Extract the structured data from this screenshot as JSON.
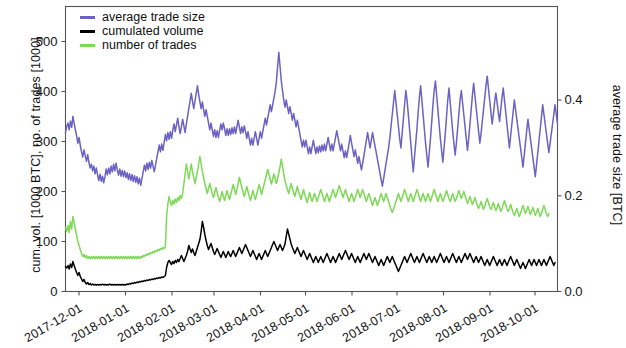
{
  "chart_data": {
    "type": "line",
    "title": "",
    "xlabel": "",
    "ylabel": "cum. vol. [1000 BTC], no. of trades [1000]",
    "y2label": "average trade size [BTC]",
    "grid": false,
    "legend_position": "upper-left-inside",
    "xlim": [
      "2017-11-22",
      "2018-10-16"
    ],
    "ylim": [
      0,
      570
    ],
    "y2lim": [
      0,
      0.5955
    ],
    "yticks": [
      0,
      100,
      200,
      300,
      400,
      500
    ],
    "ytick_labels": [
      "0",
      "100",
      "200",
      "300",
      "400",
      "500"
    ],
    "y2ticks": [
      0.0,
      0.2,
      0.4
    ],
    "y2tick_labels": [
      "0.0",
      "0.2",
      "0.4"
    ],
    "xticks": [
      "2017-12-01",
      "2018-01-01",
      "2018-02-01",
      "2018-03-01",
      "2018-04-01",
      "2018-05-01",
      "2018-06-01",
      "2018-07-01",
      "2018-08-01",
      "2018-09-01",
      "2018-10-01"
    ],
    "series": [
      {
        "name": "average trade size",
        "axis": "right",
        "color": "#6a63c4",
        "unit": "BTC",
        "values": [
          0.332,
          0.345,
          0.352,
          0.338,
          0.356,
          0.343,
          0.366,
          0.352,
          0.338,
          0.325,
          0.31,
          0.322,
          0.305,
          0.292,
          0.281,
          0.296,
          0.284,
          0.272,
          0.286,
          0.27,
          0.258,
          0.266,
          0.252,
          0.262,
          0.246,
          0.258,
          0.244,
          0.232,
          0.245,
          0.23,
          0.241,
          0.227,
          0.24,
          0.256,
          0.244,
          0.258,
          0.246,
          0.262,
          0.25,
          0.266,
          0.252,
          0.268,
          0.254,
          0.243,
          0.256,
          0.241,
          0.253,
          0.24,
          0.252,
          0.238,
          0.248,
          0.234,
          0.246,
          0.232,
          0.244,
          0.23,
          0.242,
          0.228,
          0.24,
          0.225,
          0.237,
          0.222,
          0.236,
          0.25,
          0.264,
          0.252,
          0.268,
          0.255,
          0.27,
          0.258,
          0.274,
          0.262,
          0.25,
          0.264,
          0.278,
          0.292,
          0.306,
          0.292,
          0.308,
          0.295,
          0.312,
          0.328,
          0.315,
          0.332,
          0.318,
          0.334,
          0.32,
          0.336,
          0.35,
          0.334,
          0.348,
          0.362,
          0.345,
          0.33,
          0.344,
          0.36,
          0.346,
          0.332,
          0.35,
          0.366,
          0.382,
          0.398,
          0.414,
          0.398,
          0.382,
          0.398,
          0.414,
          0.43,
          0.412,
          0.396,
          0.382,
          0.396,
          0.38,
          0.366,
          0.38,
          0.366,
          0.352,
          0.338,
          0.352,
          0.338,
          0.324,
          0.338,
          0.322,
          0.336,
          0.322,
          0.336,
          0.35,
          0.338,
          0.352,
          0.34,
          0.326,
          0.34,
          0.326,
          0.34,
          0.328,
          0.342,
          0.33,
          0.344,
          0.33,
          0.344,
          0.358,
          0.344,
          0.33,
          0.344,
          0.332,
          0.346,
          0.334,
          0.32,
          0.334,
          0.32,
          0.306,
          0.32,
          0.306,
          0.32,
          0.334,
          0.32,
          0.306,
          0.32,
          0.334,
          0.32,
          0.334,
          0.348,
          0.362,
          0.348,
          0.362,
          0.376,
          0.39,
          0.376,
          0.39,
          0.404,
          0.418,
          0.438,
          0.47,
          0.5,
          0.47,
          0.44,
          0.42,
          0.4,
          0.385,
          0.4,
          0.386,
          0.372,
          0.386,
          0.372,
          0.358,
          0.372,
          0.358,
          0.344,
          0.358,
          0.344,
          0.33,
          0.316,
          0.302,
          0.316,
          0.302,
          0.316,
          0.302,
          0.288,
          0.302,
          0.288,
          0.302,
          0.316,
          0.302,
          0.288,
          0.302,
          0.29,
          0.304,
          0.292,
          0.306,
          0.294,
          0.308,
          0.294,
          0.308,
          0.322,
          0.308,
          0.294,
          0.308,
          0.294,
          0.308,
          0.322,
          0.336,
          0.322,
          0.308,
          0.294,
          0.308,
          0.294,
          0.28,
          0.294,
          0.28,
          0.294,
          0.31,
          0.326,
          0.31,
          0.296,
          0.282,
          0.296,
          0.282,
          0.268,
          0.282,
          0.268,
          0.254,
          0.268,
          0.284,
          0.3,
          0.316,
          0.332,
          0.316,
          0.3,
          0.316,
          0.332,
          0.318,
          0.304,
          0.29,
          0.276,
          0.262,
          0.248,
          0.234,
          0.22,
          0.236,
          0.252,
          0.268,
          0.284,
          0.3,
          0.32,
          0.345,
          0.37,
          0.395,
          0.42,
          0.395,
          0.37,
          0.345,
          0.32,
          0.3,
          0.33,
          0.36,
          0.39,
          0.42,
          0.4,
          0.37,
          0.34,
          0.31,
          0.28,
          0.25,
          0.28,
          0.31,
          0.34,
          0.375,
          0.405,
          0.43,
          0.4,
          0.37,
          0.34,
          0.31,
          0.285,
          0.26,
          0.29,
          0.32,
          0.355,
          0.39,
          0.42,
          0.44,
          0.41,
          0.38,
          0.35,
          0.32,
          0.295,
          0.27,
          0.3,
          0.33,
          0.365,
          0.4,
          0.425,
          0.395,
          0.365,
          0.335,
          0.31,
          0.285,
          0.31,
          0.34,
          0.37,
          0.4,
          0.42,
          0.395,
          0.37,
          0.345,
          0.32,
          0.295,
          0.32,
          0.35,
          0.38,
          0.41,
          0.435,
          0.41,
          0.385,
          0.36,
          0.335,
          0.31,
          0.33,
          0.355,
          0.38,
          0.405,
          0.43,
          0.45,
          0.425,
          0.4,
          0.375,
          0.35,
          0.37,
          0.395,
          0.415,
          0.395,
          0.375,
          0.355,
          0.38,
          0.405,
          0.425,
          0.4,
          0.375,
          0.35,
          0.325,
          0.3,
          0.325,
          0.35,
          0.375,
          0.4,
          0.38,
          0.36,
          0.34,
          0.32,
          0.3,
          0.28,
          0.26,
          0.285,
          0.31,
          0.335,
          0.36,
          0.34,
          0.32,
          0.3,
          0.28,
          0.26,
          0.24,
          0.265,
          0.29,
          0.315,
          0.34,
          0.365,
          0.39,
          0.37,
          0.35,
          0.33,
          0.31,
          0.29,
          0.31,
          0.33,
          0.35,
          0.37,
          0.39,
          0.37,
          0.35
        ]
      },
      {
        "name": "cumulated volume",
        "axis": "left",
        "color": "#000000",
        "unit": "1000 BTC",
        "values": [
          50,
          47,
          52,
          45,
          55,
          48,
          60,
          52,
          45,
          38,
          32,
          38,
          30,
          25,
          20,
          24,
          18,
          15,
          18,
          14,
          16,
          13,
          15,
          13,
          14,
          13,
          14,
          13,
          14,
          13,
          15,
          13,
          14,
          13,
          14,
          13,
          15,
          13,
          14,
          13,
          14,
          13,
          14,
          13,
          14,
          13,
          14,
          13,
          14,
          13,
          15,
          14,
          16,
          15,
          17,
          16,
          18,
          17,
          19,
          18,
          20,
          19,
          21,
          20,
          22,
          21,
          23,
          22,
          24,
          23,
          25,
          24,
          26,
          25,
          27,
          26,
          28,
          27,
          29,
          28,
          30,
          32,
          48,
          58,
          62,
          58,
          54,
          60,
          56,
          62,
          58,
          64,
          60,
          66,
          72,
          66,
          60,
          66,
          72,
          80,
          92,
          85,
          78,
          85,
          78,
          72,
          80,
          88,
          96,
          104,
          120,
          140,
          128,
          114,
          102,
          92,
          84,
          90,
          96,
          88,
          80,
          74,
          80,
          86,
          80,
          74,
          68,
          74,
          80,
          74,
          68,
          74,
          80,
          74,
          70,
          76,
          82,
          76,
          70,
          76,
          82,
          88,
          82,
          76,
          82,
          88,
          94,
          88,
          82,
          76,
          70,
          76,
          82,
          76,
          70,
          64,
          70,
          76,
          70,
          64,
          70,
          76,
          82,
          76,
          70,
          76,
          82,
          88,
          94,
          100,
          94,
          88,
          82,
          88,
          94,
          88,
          82,
          88,
          95,
          110,
          125,
          115,
          105,
          95,
          88,
          82,
          76,
          82,
          88,
          82,
          76,
          70,
          76,
          82,
          76,
          70,
          64,
          70,
          76,
          70,
          64,
          58,
          64,
          70,
          64,
          58,
          64,
          70,
          64,
          58,
          64,
          70,
          76,
          70,
          64,
          58,
          64,
          70,
          64,
          58,
          64,
          70,
          76,
          70,
          64,
          70,
          76,
          82,
          76,
          70,
          64,
          70,
          76,
          70,
          64,
          58,
          64,
          70,
          64,
          58,
          64,
          70,
          76,
          70,
          64,
          70,
          76,
          70,
          64,
          58,
          64,
          70,
          64,
          58,
          52,
          58,
          64,
          58,
          52,
          58,
          64,
          70,
          64,
          58,
          64,
          70,
          64,
          58,
          52,
          46,
          40,
          46,
          52,
          58,
          64,
          70,
          64,
          58,
          64,
          70,
          76,
          70,
          64,
          58,
          64,
          70,
          64,
          58,
          64,
          70,
          76,
          70,
          64,
          58,
          64,
          70,
          64,
          58,
          64,
          70,
          64,
          58,
          64,
          70,
          76,
          70,
          64,
          58,
          64,
          70,
          64,
          58,
          64,
          70,
          76,
          70,
          64,
          58,
          64,
          70,
          64,
          58,
          64,
          70,
          76,
          70,
          64,
          70,
          76,
          70,
          64,
          58,
          64,
          70,
          64,
          58,
          64,
          70,
          64,
          58,
          52,
          58,
          64,
          58,
          52,
          58,
          64,
          70,
          64,
          58,
          52,
          58,
          64,
          58,
          52,
          58,
          64,
          58,
          52,
          58,
          64,
          70,
          64,
          58,
          52,
          58,
          64,
          58,
          52,
          46,
          52,
          58,
          52,
          46,
          52,
          58,
          64,
          58,
          52,
          58,
          64,
          58,
          52,
          58,
          64,
          58,
          52,
          58,
          64,
          58,
          52,
          58,
          64,
          70,
          64,
          58,
          52,
          58
        ]
      },
      {
        "name": "number of trades",
        "axis": "left",
        "color": "#7ed957",
        "unit": "1000 trades",
        "values": [
          128,
          120,
          132,
          118,
          140,
          125,
          150,
          138,
          125,
          112,
          100,
          92,
          84,
          76,
          70,
          74,
          68,
          72,
          66,
          70,
          65,
          70,
          66,
          70,
          66,
          70,
          66,
          70,
          66,
          70,
          66,
          70,
          66,
          70,
          66,
          70,
          66,
          70,
          66,
          70,
          66,
          70,
          66,
          70,
          66,
          70,
          66,
          70,
          66,
          70,
          66,
          70,
          66,
          70,
          66,
          70,
          66,
          70,
          66,
          70,
          66,
          70,
          68,
          72,
          70,
          74,
          72,
          76,
          74,
          78,
          76,
          80,
          78,
          82,
          80,
          84,
          82,
          86,
          84,
          88,
          86,
          90,
          150,
          175,
          190,
          180,
          172,
          182,
          175,
          185,
          178,
          188,
          182,
          192,
          186,
          196,
          215,
          235,
          255,
          240,
          225,
          240,
          255,
          240,
          228,
          216,
          228,
          240,
          255,
          270,
          255,
          240,
          228,
          216,
          206,
          196,
          206,
          216,
          206,
          196,
          188,
          198,
          208,
          198,
          188,
          180,
          190,
          200,
          190,
          182,
          192,
          202,
          192,
          184,
          194,
          204,
          214,
          204,
          194,
          204,
          216,
          228,
          218,
          208,
          198,
          190,
          200,
          210,
          200,
          190,
          182,
          192,
          202,
          192,
          184,
          194,
          204,
          214,
          204,
          194,
          204,
          214,
          224,
          234,
          244,
          234,
          224,
          215,
          225,
          235,
          225,
          216,
          226,
          238,
          250,
          265,
          250,
          235,
          222,
          212,
          204,
          196,
          206,
          216,
          206,
          198,
          190,
          200,
          210,
          200,
          192,
          184,
          194,
          204,
          194,
          186,
          178,
          188,
          198,
          188,
          180,
          188,
          196,
          188,
          180,
          188,
          196,
          204,
          196,
          188,
          180,
          188,
          196,
          188,
          180,
          188,
          196,
          204,
          196,
          188,
          196,
          204,
          212,
          204,
          196,
          188,
          196,
          204,
          196,
          188,
          180,
          188,
          196,
          188,
          180,
          188,
          196,
          204,
          196,
          188,
          196,
          204,
          196,
          188,
          180,
          188,
          196,
          188,
          180,
          172,
          180,
          188,
          180,
          172,
          180,
          188,
          196,
          188,
          180,
          188,
          196,
          188,
          180,
          172,
          164,
          158,
          164,
          172,
          180,
          188,
          196,
          188,
          180,
          188,
          196,
          204,
          196,
          188,
          180,
          188,
          196,
          188,
          180,
          188,
          196,
          204,
          196,
          188,
          180,
          188,
          196,
          188,
          180,
          188,
          196,
          188,
          180,
          188,
          196,
          204,
          196,
          188,
          180,
          188,
          196,
          188,
          180,
          186,
          194,
          202,
          194,
          186,
          180,
          188,
          196,
          188,
          180,
          186,
          194,
          202,
          194,
          186,
          192,
          200,
          192,
          184,
          176,
          182,
          190,
          182,
          174,
          180,
          188,
          180,
          172,
          166,
          172,
          180,
          172,
          164,
          170,
          178,
          186,
          178,
          170,
          164,
          170,
          178,
          170,
          162,
          168,
          176,
          168,
          160,
          166,
          174,
          182,
          174,
          166,
          160,
          166,
          174,
          166,
          158,
          152,
          158,
          166,
          158,
          150,
          156,
          164,
          172,
          164,
          156,
          162,
          170,
          162,
          154,
          160,
          168,
          160,
          152,
          158,
          166,
          158,
          150,
          156,
          164,
          172,
          164,
          156,
          150,
          156
        ]
      }
    ]
  },
  "legend": {
    "items": [
      {
        "label": "average trade size",
        "color": "#6a63c4"
      },
      {
        "label": "cumulated volume",
        "color": "#000000"
      },
      {
        "label": "number of trades",
        "color": "#7ed957"
      }
    ]
  },
  "axes": {
    "left_title": "cum. vol. [1000 BTC], no. of trades [1000]",
    "right_title": "average trade size [BTC]"
  }
}
